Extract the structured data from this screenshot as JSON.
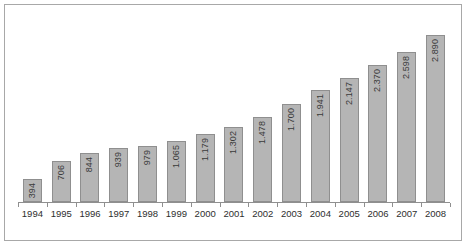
{
  "chart_data": {
    "type": "bar",
    "title": "",
    "subtitle": "",
    "xlabel": "",
    "ylabel": "",
    "categories": [
      "1994",
      "1995",
      "1996",
      "1997",
      "1998",
      "1999",
      "2000",
      "2001",
      "2002",
      "2003",
      "2004",
      "2005",
      "2006",
      "2007",
      "2008"
    ],
    "values": [
      394,
      706,
      844,
      939,
      979,
      1065,
      1179,
      1302,
      1478,
      1700,
      1941,
      2147,
      2370,
      2598,
      2890
    ],
    "value_labels": [
      "394",
      "706",
      "844",
      "939",
      "979",
      "1.065",
      "1.179",
      "1.302",
      "1.478",
      "1.700",
      "1.941",
      "2.147",
      "2.370",
      "2.598",
      "2.890"
    ],
    "ylim": [
      0,
      3050
    ],
    "grid": false,
    "legend": null,
    "legend_position": "none",
    "value_label_rotation": 90,
    "value_label_position": "inside-top",
    "axis_tick_labels_visible": true,
    "y_axis_visible": false,
    "colors": {
      "bar_fill": "#b5b5b5",
      "bar_border": "#8f8f8f",
      "axis_line": "#8f8f8f",
      "label_text": "#2e2e2e",
      "value_text": "#3a3a3a",
      "frame_border": "#a8a8a8",
      "background": "#ffffff"
    }
  }
}
